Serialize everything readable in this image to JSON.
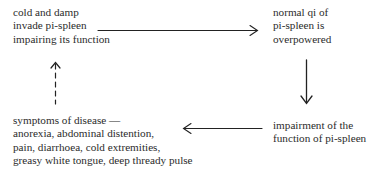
{
  "diagram": {
    "type": "cycle-flowchart",
    "nodes": [
      {
        "id": "n1",
        "lines": [
          "cold and damp",
          "invade pi-spleen",
          "impairing its function"
        ]
      },
      {
        "id": "n2",
        "lines": [
          "normal qi of",
          "pi-spleen is",
          "overpowered"
        ]
      },
      {
        "id": "n3",
        "lines": [
          "impairment of the",
          "function of pi-spleen"
        ]
      },
      {
        "id": "n4",
        "lines": [
          "symptoms of disease —",
          "anorexia, abdominal distention,",
          "pain, diarrhoea, cold extremities,",
          "greasy white tongue, deep thready pulse"
        ]
      }
    ],
    "edges": [
      {
        "from": "n1",
        "to": "n2",
        "direction": "right",
        "style": "solid"
      },
      {
        "from": "n2",
        "to": "n3",
        "direction": "down",
        "style": "solid"
      },
      {
        "from": "n3",
        "to": "n4",
        "direction": "left",
        "style": "solid"
      },
      {
        "from": "n4",
        "to": "n1",
        "direction": "up",
        "style": "dashed"
      }
    ],
    "colors": {
      "text": "#2b2b2b",
      "line": "#222222",
      "background": "#ffffff"
    }
  }
}
